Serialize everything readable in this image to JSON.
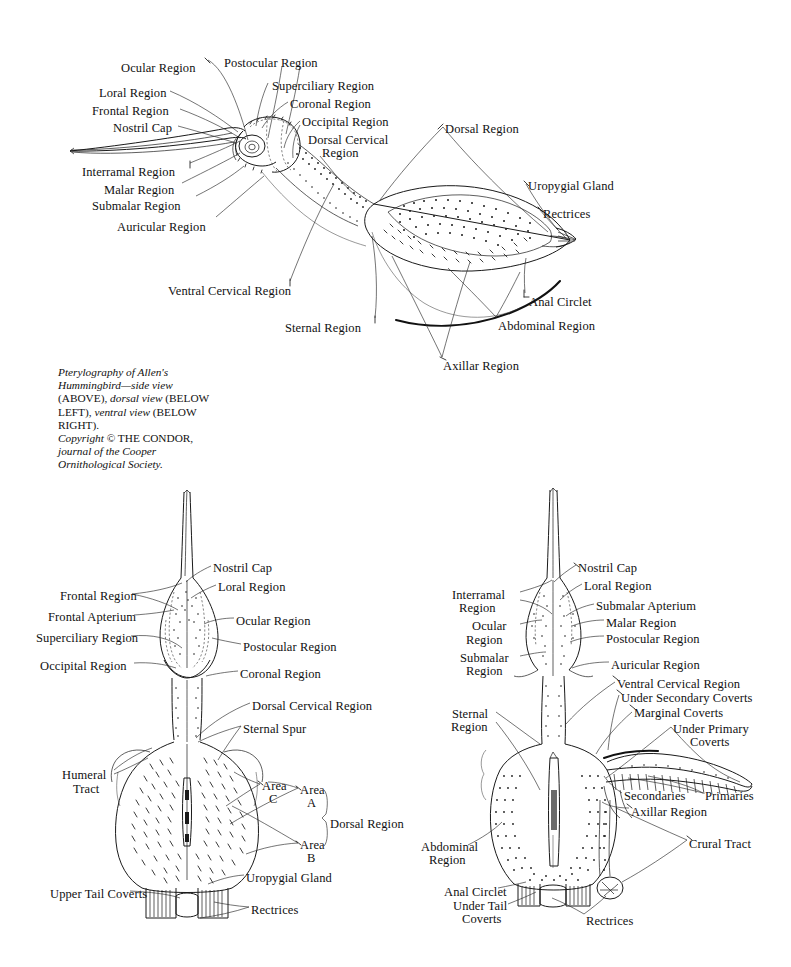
{
  "document": {
    "title": "Pterylography of Allen's Hummingbird",
    "background_color": "#ffffff",
    "ink_color": "#111111",
    "width": 791,
    "height": 967
  },
  "caption": {
    "line1_italic": "Pterylography of Allen's",
    "line2_italic": "Hummingbird—side view",
    "line3_smallcaps_a": "(ABOVE), ",
    "line3_italic": "dorsal view",
    "line3_smallcaps_b": " (BELOW",
    "line4_smallcaps_a": "LEFT), ",
    "line4_italic": "ventral view",
    "line4_smallcaps_b": " (BELOW",
    "line5_smallcaps": "RIGHT).",
    "line6_italic": "Copyright",
    "line6_rest": " © THE CONDOR,",
    "line7_italic": "journal of the Cooper",
    "line8_italic": "Ornithological Society."
  },
  "figures": [
    {
      "id": "side-view",
      "name": "Side view (above)",
      "labels": [
        {
          "id": "s-ocular",
          "text": "Ocular Region",
          "x": 121,
          "y": 62,
          "align": "left"
        },
        {
          "id": "s-postocular",
          "text": "Postocular Region",
          "x": 224,
          "y": 57,
          "align": "left"
        },
        {
          "id": "s-superciliary",
          "text": "Superciliary Region",
          "x": 272,
          "y": 80,
          "align": "left"
        },
        {
          "id": "s-loral",
          "text": "Loral Region",
          "x": 99,
          "y": 87,
          "align": "left"
        },
        {
          "id": "s-coronal",
          "text": "Coronal Region",
          "x": 290,
          "y": 98,
          "align": "left"
        },
        {
          "id": "s-frontal",
          "text": "Frontal Region",
          "x": 92,
          "y": 105,
          "align": "left"
        },
        {
          "id": "s-occipital",
          "text": "Occipital Region",
          "x": 302,
          "y": 116,
          "align": "left"
        },
        {
          "id": "s-nostril",
          "text": "Nostril Cap",
          "x": 113,
          "y": 122,
          "align": "left"
        },
        {
          "id": "s-dorsal-cerv-1",
          "text": "Dorsal Cervical",
          "x": 308,
          "y": 134,
          "align": "left"
        },
        {
          "id": "s-dorsal-cerv-2",
          "text": "Region",
          "x": 322,
          "y": 147,
          "align": "left"
        },
        {
          "id": "s-dorsal-region",
          "text": "Dorsal Region",
          "x": 445,
          "y": 123,
          "align": "left"
        },
        {
          "id": "s-interramal",
          "text": "Interramal Region",
          "x": 82,
          "y": 166,
          "align": "left"
        },
        {
          "id": "s-uropygial",
          "text": "Uropygial Gland",
          "x": 528,
          "y": 180,
          "align": "left"
        },
        {
          "id": "s-malar",
          "text": "Malar Region",
          "x": 104,
          "y": 184,
          "align": "left"
        },
        {
          "id": "s-rectrices",
          "text": "Rectrices",
          "x": 543,
          "y": 208,
          "align": "left"
        },
        {
          "id": "s-submalar",
          "text": "Submalar Region",
          "x": 92,
          "y": 200,
          "align": "left"
        },
        {
          "id": "s-auricular",
          "text": "Auricular Region",
          "x": 117,
          "y": 221,
          "align": "left"
        },
        {
          "id": "s-ventral-cerv",
          "text": "Ventral Cervical Region",
          "x": 168,
          "y": 285,
          "align": "left"
        },
        {
          "id": "s-anal-circlet",
          "text": "Anal Circlet",
          "x": 529,
          "y": 296,
          "align": "left"
        },
        {
          "id": "s-sternal",
          "text": "Sternal Region",
          "x": 285,
          "y": 322,
          "align": "left"
        },
        {
          "id": "s-abdominal",
          "text": "Abdominal Region",
          "x": 498,
          "y": 320,
          "align": "left"
        },
        {
          "id": "s-axillar",
          "text": "Axillar Region",
          "x": 443,
          "y": 360,
          "align": "left"
        }
      ]
    },
    {
      "id": "dorsal-view",
      "name": "Dorsal view (below left)",
      "labels": [
        {
          "id": "d-nostril",
          "text": "Nostril Cap",
          "x": 213,
          "y": 562,
          "align": "left"
        },
        {
          "id": "d-loral",
          "text": "Loral Region",
          "x": 218,
          "y": 581,
          "align": "left"
        },
        {
          "id": "d-frontal-reg",
          "text": "Frontal Region",
          "x": 60,
          "y": 590,
          "align": "left"
        },
        {
          "id": "d-frontal-apt",
          "text": "Frontal Apterium",
          "x": 48,
          "y": 611,
          "align": "left"
        },
        {
          "id": "d-ocular",
          "text": "Ocular Region",
          "x": 236,
          "y": 615,
          "align": "left"
        },
        {
          "id": "d-superciliary",
          "text": "Superciliary Region",
          "x": 36,
          "y": 632,
          "align": "left"
        },
        {
          "id": "d-postocular",
          "text": "Postocular Region",
          "x": 243,
          "y": 641,
          "align": "left"
        },
        {
          "id": "d-occipital",
          "text": "Occipital Region",
          "x": 40,
          "y": 660,
          "align": "left"
        },
        {
          "id": "d-coronal",
          "text": "Coronal Region",
          "x": 240,
          "y": 668,
          "align": "left"
        },
        {
          "id": "d-dorsal-cerv",
          "text": "Dorsal Cervical Region",
          "x": 252,
          "y": 700,
          "align": "left"
        },
        {
          "id": "d-sternal-spur",
          "text": "Sternal Spur",
          "x": 243,
          "y": 723,
          "align": "left"
        },
        {
          "id": "d-humeral-1",
          "text": "Humeral",
          "x": 62,
          "y": 769,
          "align": "left"
        },
        {
          "id": "d-humeral-2",
          "text": "Tract",
          "x": 73,
          "y": 783,
          "align": "left"
        },
        {
          "id": "d-area-c-1",
          "text": "Area",
          "x": 262,
          "y": 780,
          "align": "left"
        },
        {
          "id": "d-area-c-2",
          "text": "C",
          "x": 269,
          "y": 793,
          "align": "left"
        },
        {
          "id": "d-area-a-1",
          "text": "Area",
          "x": 300,
          "y": 784,
          "align": "left"
        },
        {
          "id": "d-area-a-2",
          "text": "A",
          "x": 307,
          "y": 797,
          "align": "left"
        },
        {
          "id": "d-dorsal-region",
          "text": "Dorsal Region",
          "x": 330,
          "y": 818,
          "align": "left"
        },
        {
          "id": "d-area-b-1",
          "text": "Area",
          "x": 300,
          "y": 839,
          "align": "left"
        },
        {
          "id": "d-area-b-2",
          "text": "B",
          "x": 307,
          "y": 852,
          "align": "left"
        },
        {
          "id": "d-uropygial",
          "text": "Uropygial Gland",
          "x": 246,
          "y": 872,
          "align": "left"
        },
        {
          "id": "d-upper-tail",
          "text": "Upper Tail Coverts",
          "x": 50,
          "y": 888,
          "align": "left"
        },
        {
          "id": "d-rectrices",
          "text": "Rectrices",
          "x": 251,
          "y": 904,
          "align": "left"
        }
      ]
    },
    {
      "id": "ventral-view",
      "name": "Ventral view (below right)",
      "labels": [
        {
          "id": "v-nostril",
          "text": "Nostril Cap",
          "x": 578,
          "y": 562,
          "align": "left"
        },
        {
          "id": "v-loral",
          "text": "Loral Region",
          "x": 584,
          "y": 580,
          "align": "left"
        },
        {
          "id": "v-interramal-1",
          "text": "Interramal",
          "x": 452,
          "y": 589,
          "align": "left"
        },
        {
          "id": "v-interramal-2",
          "text": "Region",
          "x": 459,
          "y": 602,
          "align": "left"
        },
        {
          "id": "v-submalar-apt",
          "text": "Submalar Apterium",
          "x": 596,
          "y": 600,
          "align": "left"
        },
        {
          "id": "v-malar",
          "text": "Malar Region",
          "x": 606,
          "y": 617,
          "align": "left"
        },
        {
          "id": "v-ocular-1",
          "text": "Ocular",
          "x": 472,
          "y": 620,
          "align": "left"
        },
        {
          "id": "v-ocular-2",
          "text": "Region",
          "x": 466,
          "y": 634,
          "align": "left"
        },
        {
          "id": "v-postocular",
          "text": "Postocular Region",
          "x": 606,
          "y": 633,
          "align": "left"
        },
        {
          "id": "v-submalar-1",
          "text": "Submalar",
          "x": 460,
          "y": 652,
          "align": "left"
        },
        {
          "id": "v-submalar-2",
          "text": "Region",
          "x": 466,
          "y": 665,
          "align": "left"
        },
        {
          "id": "v-auricular",
          "text": "Auricular Region",
          "x": 611,
          "y": 659,
          "align": "left"
        },
        {
          "id": "v-ventral-cerv",
          "text": "Ventral Cervical Region",
          "x": 617,
          "y": 678,
          "align": "left"
        },
        {
          "id": "v-under-sec-cov",
          "text": "Under Secondary Coverts",
          "x": 621,
          "y": 692,
          "align": "left"
        },
        {
          "id": "v-marginal-cov",
          "text": "Marginal Coverts",
          "x": 634,
          "y": 707,
          "align": "left"
        },
        {
          "id": "v-under-prim-1",
          "text": "Under Primary",
          "x": 673,
          "y": 723,
          "align": "left"
        },
        {
          "id": "v-under-prim-2",
          "text": "Coverts",
          "x": 690,
          "y": 736,
          "align": "left"
        },
        {
          "id": "v-sternal-1",
          "text": "Sternal",
          "x": 452,
          "y": 708,
          "align": "left"
        },
        {
          "id": "v-sternal-2",
          "text": "Region",
          "x": 451,
          "y": 721,
          "align": "left"
        },
        {
          "id": "v-secondaries",
          "text": "Secondaries",
          "x": 624,
          "y": 790,
          "align": "left"
        },
        {
          "id": "v-primaries",
          "text": "Primaries",
          "x": 705,
          "y": 790,
          "align": "left"
        },
        {
          "id": "v-axillar",
          "text": "Axillar Region",
          "x": 631,
          "y": 806,
          "align": "left"
        },
        {
          "id": "v-crural",
          "text": "Crural Tract",
          "x": 689,
          "y": 838,
          "align": "left"
        },
        {
          "id": "v-abdominal-1",
          "text": "Abdominal",
          "x": 421,
          "y": 841,
          "align": "left"
        },
        {
          "id": "v-abdominal-2",
          "text": "Region",
          "x": 429,
          "y": 854,
          "align": "left"
        },
        {
          "id": "v-anal-circlet",
          "text": "Anal Circlet",
          "x": 444,
          "y": 886,
          "align": "left"
        },
        {
          "id": "v-under-tail-1",
          "text": "Under Tail",
          "x": 453,
          "y": 900,
          "align": "left"
        },
        {
          "id": "v-under-tail-2",
          "text": "Coverts",
          "x": 462,
          "y": 913,
          "align": "left"
        },
        {
          "id": "v-rectrices",
          "text": "Rectrices",
          "x": 586,
          "y": 915,
          "align": "left"
        }
      ]
    }
  ]
}
